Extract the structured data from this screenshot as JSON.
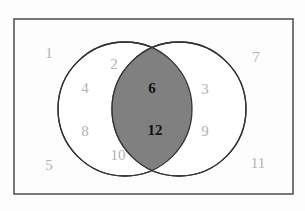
{
  "figure": {
    "kind": "venn-diagram",
    "sets": 2,
    "universe_label": "",
    "background_color": "#fdfdfd",
    "border_color": "#555555",
    "outside_number_color": "#b2b2b2",
    "inside_number_color": "#111111",
    "intersection_fill_color": "#808080",
    "circle_stroke_color": "#333333",
    "circle_fill_color": "#ffffff"
  },
  "regions": {
    "outside_both": {
      "name": "outside-both-circles",
      "values": [
        "1",
        "5",
        "7",
        "11"
      ]
    },
    "left_only": {
      "name": "left-circle-only",
      "values": [
        "2",
        "4",
        "8",
        "10"
      ]
    },
    "right_only": {
      "name": "right-circle-only",
      "values": [
        "3",
        "9"
      ]
    },
    "intersection": {
      "name": "intersection",
      "values": [
        "6",
        "12"
      ]
    }
  },
  "numbers": [
    {
      "id": "n1",
      "label": "1",
      "region": "outside",
      "x": 49,
      "y": 53
    },
    {
      "id": "n2",
      "label": "2",
      "region": "left",
      "x": 114,
      "y": 64
    },
    {
      "id": "n3",
      "label": "3",
      "region": "right",
      "x": 205,
      "y": 89
    },
    {
      "id": "n4",
      "label": "4",
      "region": "left",
      "x": 85,
      "y": 88
    },
    {
      "id": "n5",
      "label": "5",
      "region": "outside",
      "x": 49,
      "y": 165
    },
    {
      "id": "n6",
      "label": "6",
      "region": "intersection",
      "x": 152,
      "y": 88
    },
    {
      "id": "n7",
      "label": "7",
      "region": "outside",
      "x": 256,
      "y": 57
    },
    {
      "id": "n8",
      "label": "8",
      "region": "left",
      "x": 85,
      "y": 131
    },
    {
      "id": "n9",
      "label": "9",
      "region": "right",
      "x": 205,
      "y": 131
    },
    {
      "id": "n10",
      "label": "10",
      "region": "left",
      "x": 118,
      "y": 155
    },
    {
      "id": "n11",
      "label": "11",
      "region": "outside",
      "x": 258,
      "y": 163
    },
    {
      "id": "n12",
      "label": "12",
      "region": "intersection",
      "x": 155,
      "y": 130
    }
  ],
  "geometry": {
    "rect": {
      "x": 14,
      "y": 19,
      "width": 279,
      "height": 175
    },
    "left_circle": {
      "cx": 125,
      "cy": 109,
      "r": 67
    },
    "right_circle": {
      "cx": 179,
      "cy": 109,
      "r": 67
    }
  }
}
